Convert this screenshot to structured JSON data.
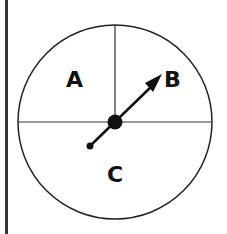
{
  "spinner": {
    "sections": [
      {
        "label": "A",
        "region": "upper-left quarter"
      },
      {
        "label": "B",
        "region": "upper-right quarter"
      },
      {
        "label": "C",
        "region": "lower half"
      }
    ],
    "pointer_direction": "B",
    "colors": {
      "line": "#222222",
      "fill": "#ffffff",
      "border": "#333333"
    }
  }
}
